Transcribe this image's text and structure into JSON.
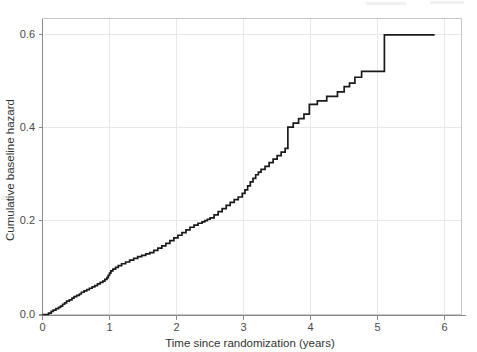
{
  "figure": {
    "background_color": "#ffffff",
    "line_color": "#1a1a1a",
    "grid_color": "#e8e8e8",
    "axis_color": "#8a8a8a",
    "text_color": "#4a4a4a"
  },
  "chart_data": {
    "type": "line",
    "subtype": "step",
    "title": "",
    "xlabel": "Time since randomization (years)",
    "ylabel": "Cumulative baseline hazard",
    "xlim": [
      0,
      6.25
    ],
    "ylim": [
      0,
      0.665
    ],
    "xticks": [
      0,
      1,
      2,
      3,
      4,
      5,
      6
    ],
    "xtick_labels": [
      "0",
      "1",
      "2",
      "3",
      "4",
      "5",
      "6"
    ],
    "yticks": [
      0.0,
      0.2,
      0.4,
      0.6
    ],
    "ytick_labels": [
      "0.0",
      "0.2",
      "0.4",
      "0.6"
    ],
    "grid": true,
    "legend": null,
    "series": [
      {
        "name": "Cumulative baseline hazard",
        "color": "#1a1a1a",
        "x": [
          0.0,
          0.09,
          0.13,
          0.16,
          0.2,
          0.24,
          0.27,
          0.3,
          0.33,
          0.36,
          0.4,
          0.44,
          0.47,
          0.51,
          0.55,
          0.58,
          0.62,
          0.66,
          0.7,
          0.74,
          0.78,
          0.82,
          0.86,
          0.9,
          0.93,
          0.96,
          0.98,
          1.0,
          1.02,
          1.05,
          1.09,
          1.13,
          1.18,
          1.24,
          1.3,
          1.36,
          1.42,
          1.48,
          1.54,
          1.6,
          1.66,
          1.72,
          1.78,
          1.84,
          1.9,
          1.96,
          2.02,
          2.08,
          2.14,
          2.2,
          2.26,
          2.32,
          2.38,
          2.42,
          2.46,
          2.5,
          2.56,
          2.62,
          2.68,
          2.74,
          2.8,
          2.86,
          2.92,
          2.98,
          3.02,
          3.06,
          3.1,
          3.14,
          3.18,
          3.22,
          3.26,
          3.32,
          3.38,
          3.44,
          3.5,
          3.56,
          3.62,
          3.66,
          3.74,
          3.82,
          3.9,
          3.98,
          4.1,
          4.24,
          4.4,
          4.5,
          4.58,
          4.66,
          4.76,
          5.1,
          5.85
        ],
        "y": [
          0.0,
          0.003,
          0.007,
          0.01,
          0.013,
          0.016,
          0.019,
          0.023,
          0.026,
          0.03,
          0.033,
          0.037,
          0.04,
          0.043,
          0.046,
          0.05,
          0.053,
          0.056,
          0.059,
          0.062,
          0.065,
          0.069,
          0.072,
          0.075,
          0.079,
          0.083,
          0.088,
          0.093,
          0.098,
          0.102,
          0.106,
          0.11,
          0.114,
          0.118,
          0.122,
          0.126,
          0.13,
          0.133,
          0.136,
          0.139,
          0.144,
          0.149,
          0.154,
          0.16,
          0.166,
          0.172,
          0.178,
          0.184,
          0.19,
          0.196,
          0.201,
          0.205,
          0.208,
          0.211,
          0.214,
          0.217,
          0.224,
          0.231,
          0.238,
          0.245,
          0.252,
          0.258,
          0.264,
          0.272,
          0.28,
          0.289,
          0.298,
          0.306,
          0.314,
          0.32,
          0.326,
          0.333,
          0.341,
          0.349,
          0.357,
          0.365,
          0.373,
          0.421,
          0.43,
          0.44,
          0.45,
          0.472,
          0.48,
          0.49,
          0.5,
          0.512,
          0.52,
          0.533,
          0.546,
          0.628,
          0.628
        ]
      }
    ]
  },
  "axes": {
    "x_title": "Time since randomization (years)",
    "y_title": "Cumulative baseline hazard"
  }
}
